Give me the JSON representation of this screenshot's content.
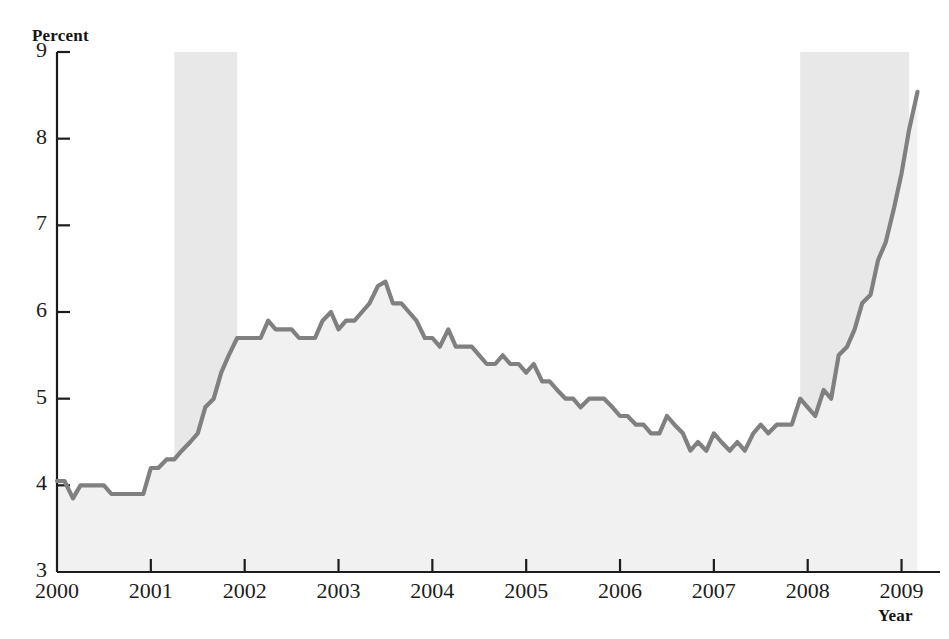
{
  "figure": {
    "ylabel": "Percent",
    "xlabel": "Year",
    "title_cropped": ""
  },
  "colors": {
    "line": "#808080",
    "area_fill": "#f1f1f1",
    "recession_band": "#e8e8e8",
    "axis": "#1c1c1c",
    "text": "#1a1a1a"
  },
  "chart_data": {
    "type": "line",
    "title": "",
    "xlabel": "Year",
    "ylabel": "Percent",
    "xlim": [
      2000,
      2009.25
    ],
    "ylim": [
      3,
      9
    ],
    "yticks": [
      3,
      4,
      5,
      6,
      7,
      8,
      9
    ],
    "xticks": [
      2000,
      2001,
      2002,
      2003,
      2004,
      2005,
      2006,
      2007,
      2008,
      2009
    ],
    "ytick_labels": [
      "3",
      "4",
      "5",
      "6",
      "7",
      "8",
      "9"
    ],
    "xtick_labels": [
      "2000",
      "2001",
      "2002",
      "2003",
      "2004",
      "2005",
      "2006",
      "2007",
      "2008",
      "2009"
    ],
    "grid": false,
    "legend": null,
    "fill_under_curve": true,
    "annotations": [
      {
        "type": "shaded-band",
        "name": "recession-2001",
        "x_start": 2001.25,
        "x_end": 2001.92
      },
      {
        "type": "shaded-band",
        "name": "recession-2008",
        "x_start": 2007.92,
        "x_end": 2009.08
      }
    ],
    "series": [
      {
        "name": "Unemployment rate",
        "x": [
          2000.0,
          2000.08,
          2000.17,
          2000.25,
          2000.33,
          2000.42,
          2000.5,
          2000.58,
          2000.67,
          2000.75,
          2000.83,
          2000.92,
          2001.0,
          2001.08,
          2001.17,
          2001.25,
          2001.33,
          2001.42,
          2001.5,
          2001.58,
          2001.67,
          2001.75,
          2001.83,
          2001.92,
          2002.0,
          2002.08,
          2002.17,
          2002.25,
          2002.33,
          2002.42,
          2002.5,
          2002.58,
          2002.67,
          2002.75,
          2002.83,
          2002.92,
          2003.0,
          2003.08,
          2003.17,
          2003.25,
          2003.33,
          2003.42,
          2003.5,
          2003.58,
          2003.67,
          2003.75,
          2003.83,
          2003.92,
          2004.0,
          2004.08,
          2004.17,
          2004.25,
          2004.33,
          2004.42,
          2004.5,
          2004.58,
          2004.67,
          2004.75,
          2004.83,
          2004.92,
          2005.0,
          2005.08,
          2005.17,
          2005.25,
          2005.33,
          2005.42,
          2005.5,
          2005.58,
          2005.67,
          2005.75,
          2005.83,
          2005.92,
          2006.0,
          2006.08,
          2006.17,
          2006.25,
          2006.33,
          2006.42,
          2006.5,
          2006.58,
          2006.67,
          2006.75,
          2006.83,
          2006.92,
          2007.0,
          2007.08,
          2007.17,
          2007.25,
          2007.33,
          2007.42,
          2007.5,
          2007.58,
          2007.67,
          2007.75,
          2007.83,
          2007.92,
          2008.0,
          2008.08,
          2008.17,
          2008.25,
          2008.33,
          2008.42,
          2008.5,
          2008.58,
          2008.67,
          2008.75,
          2008.83,
          2008.92,
          2009.0,
          2009.08,
          2009.17
        ],
        "values": [
          4.05,
          4.05,
          3.85,
          4.0,
          4.0,
          4.0,
          4.0,
          3.9,
          3.9,
          3.9,
          3.9,
          3.9,
          4.2,
          4.2,
          4.3,
          4.3,
          4.4,
          4.5,
          4.6,
          4.9,
          5.0,
          5.3,
          5.5,
          5.7,
          5.7,
          5.7,
          5.7,
          5.9,
          5.8,
          5.8,
          5.8,
          5.7,
          5.7,
          5.7,
          5.9,
          6.0,
          5.8,
          5.9,
          5.9,
          6.0,
          6.1,
          6.3,
          6.35,
          6.1,
          6.1,
          6.0,
          5.9,
          5.7,
          5.7,
          5.6,
          5.8,
          5.6,
          5.6,
          5.6,
          5.5,
          5.4,
          5.4,
          5.5,
          5.4,
          5.4,
          5.3,
          5.4,
          5.2,
          5.2,
          5.1,
          5.0,
          5.0,
          4.9,
          5.0,
          5.0,
          5.0,
          4.9,
          4.8,
          4.8,
          4.7,
          4.7,
          4.6,
          4.6,
          4.8,
          4.7,
          4.6,
          4.4,
          4.5,
          4.4,
          4.6,
          4.5,
          4.4,
          4.5,
          4.4,
          4.6,
          4.7,
          4.6,
          4.7,
          4.7,
          4.7,
          5.0,
          4.9,
          4.8,
          5.1,
          5.0,
          5.5,
          5.6,
          5.8,
          6.1,
          6.2,
          6.6,
          6.8,
          7.2,
          7.6,
          8.1,
          8.54
        ]
      }
    ]
  }
}
